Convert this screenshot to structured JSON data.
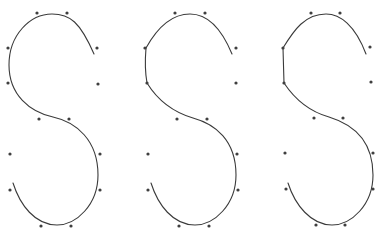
{
  "figure": {
    "stroke_color": "#3a3a3a",
    "point_color": "#3f3f3f",
    "shapes": [
      {
        "id": "s-smooth",
        "path": "M 94,54 C 80,22 70,14 52,14 C 30,14 9,35 9,65 C 9,95 30,112 53,117 C 76,122 98,140 98,175 C 98,205 76,225 57,225 C 35,225 20,205 13,183",
        "points": [
          [
            37,
            13
          ],
          [
            67,
            13
          ],
          [
            8,
            48
          ],
          [
            97,
            48
          ],
          [
            8,
            83
          ],
          [
            98,
            84
          ],
          [
            39,
            119
          ],
          [
            69,
            119
          ],
          [
            10,
            154
          ],
          [
            100,
            154
          ],
          [
            10,
            190
          ],
          [
            100,
            190
          ],
          [
            41,
            226
          ],
          [
            71,
            226
          ]
        ]
      },
      {
        "id": "s-corner",
        "path": "M 232,54 C 220,25 205,14 190,14 C 170,14 156,30 146,48 C 145,60 145,72 147,83 C 160,104 176,113 193,118 C 215,124 236,140 236,175 C 236,205 214,225 195,225 C 173,225 158,205 151,183",
        "points": [
          [
            175,
            13
          ],
          [
            205,
            13
          ],
          [
            145,
            48
          ],
          [
            236,
            48
          ],
          [
            147,
            83
          ],
          [
            236,
            83
          ],
          [
            177,
            119
          ],
          [
            207,
            119
          ],
          [
            148,
            154
          ],
          [
            237,
            154
          ],
          [
            148,
            190
          ],
          [
            238,
            190
          ],
          [
            179,
            226
          ],
          [
            209,
            226
          ]
        ]
      },
      {
        "id": "s-straight",
        "path": "M 366,54 C 355,25 340,14 326,14 C 305,14 294,30 283,48 L 284,83 C 296,101 311,112 329,117 C 352,124 373,140 373,175 C 373,205 351,225 332,225 C 311,225 295,205 288,183",
        "points": [
          [
            311,
            13
          ],
          [
            340,
            13
          ],
          [
            283,
            48
          ],
          [
            370,
            47
          ],
          [
            284,
            83
          ],
          [
            371,
            82
          ],
          [
            314,
            118
          ],
          [
            343,
            118
          ],
          [
            285,
            153
          ],
          [
            373,
            153
          ],
          [
            286,
            189
          ],
          [
            373,
            189
          ],
          [
            316,
            225
          ],
          [
            345,
            225
          ]
        ]
      }
    ]
  }
}
